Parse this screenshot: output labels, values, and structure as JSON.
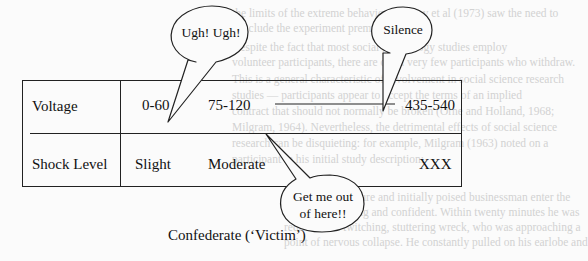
{
  "figure": {
    "caption": "Confederate (‘Victim’)",
    "rows": [
      {
        "label": "Voltage",
        "values": [
          "0-60",
          "75-120",
          "435-540"
        ]
      },
      {
        "label": "Shock Level",
        "values": [
          "Slight",
          "Moderate",
          "XXX"
        ]
      }
    ],
    "speech_bubbles": [
      {
        "id": "ugh",
        "text": "Ugh! Ugh!"
      },
      {
        "id": "silence",
        "text": "Silence"
      },
      {
        "id": "get-me-out",
        "line1": "Get me out",
        "line2": "of here!!"
      }
    ]
  },
  "background_bleed": {
    "lines": [
      "the limits of the extreme behaviour. Haney et al (1973) saw the need to",
      "conclude the experiment prematurely.",
      "Despite the fact that most social psychology studies employ",
      "volunteer participants, there are often very few participants who withdraw.",
      "This is a general characteristic of involvement in social science research",
      "studies — participants appear to accept the terms of an implied",
      "contract that should not normally be broken (Orne and Holland, 1968;",
      "Milgram, 1964). Nevertheless, the detrimental effects of social science",
      "research can be disquieting: for example, Milgram (1963) noted on a",
      "participant in his initial study description:",
      "I observed a mature and initially poised businessman enter the",
      "laboratory smiling and confident. Within twenty minutes he was",
      "reduced to a twitching, stuttering wreck, who was approaching a",
      "point of nervous collapse. He constantly pulled on his earlobe and"
    ]
  }
}
